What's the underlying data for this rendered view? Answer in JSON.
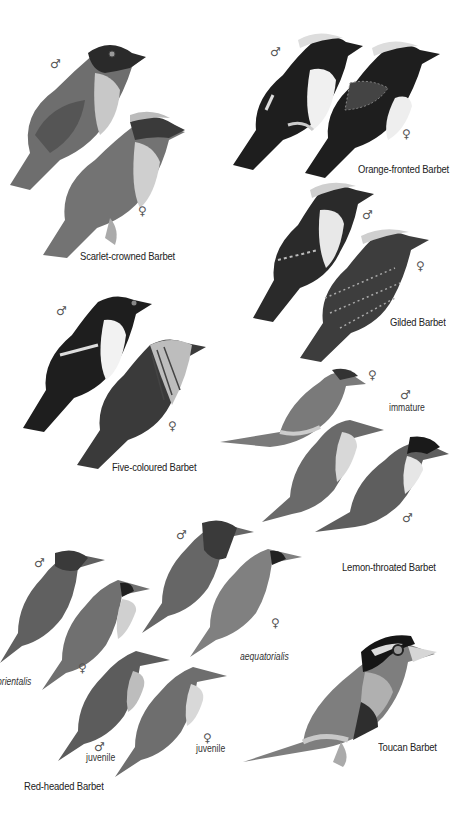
{
  "plate": {
    "groups": [
      {
        "name": "Scarlet-crowned Barbet",
        "figures": [
          {
            "sex": "♂",
            "note": ""
          },
          {
            "sex": "♀",
            "note": ""
          }
        ]
      },
      {
        "name": "Orange-fronted Barbet",
        "figures": [
          {
            "sex": "♂",
            "note": ""
          },
          {
            "sex": "♀",
            "note": ""
          }
        ]
      },
      {
        "name": "Gilded Barbet",
        "figures": [
          {
            "sex": "♂",
            "note": ""
          },
          {
            "sex": "♀",
            "note": ""
          }
        ]
      },
      {
        "name": "Five-coloured Barbet",
        "figures": [
          {
            "sex": "♂",
            "note": ""
          },
          {
            "sex": "♀",
            "note": ""
          }
        ]
      },
      {
        "name": "Lemon-throated Barbet",
        "figures": [
          {
            "sex": "♀",
            "note": ""
          },
          {
            "sex": "♂",
            "note": "immature"
          },
          {
            "sex": "♂",
            "note": ""
          }
        ]
      },
      {
        "name": "Red-headed Barbet",
        "figures": [
          {
            "sex": "♂",
            "note": ""
          },
          {
            "sex": "♀",
            "note": ""
          },
          {
            "sex": "♂",
            "note": ""
          },
          {
            "sex": "♀",
            "note": ""
          },
          {
            "sex": "♂",
            "note": "juvenile"
          },
          {
            "sex": "♀",
            "note": "juvenile"
          }
        ],
        "subspecies": [
          "orientalis",
          "aequatorialis"
        ]
      },
      {
        "name": "Toucan Barbet",
        "figures": []
      }
    ]
  }
}
